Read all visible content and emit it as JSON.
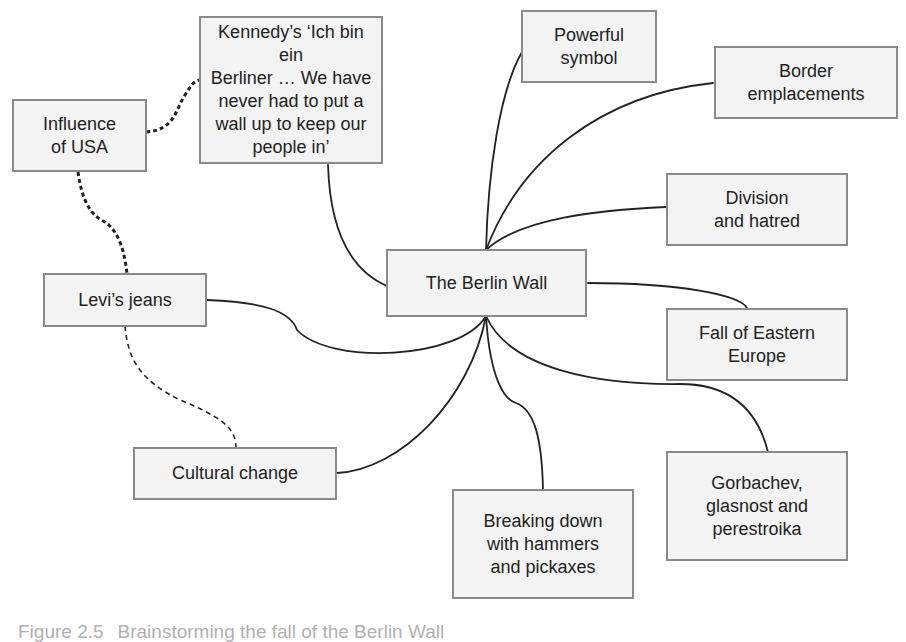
{
  "diagram": {
    "type": "mind-map",
    "central_node": {
      "id": "berlin-wall",
      "label": "The Berlin Wall"
    },
    "nodes": [
      {
        "id": "kennedy",
        "label": "Kennedy’s ‘Ich bin ein\nBerliner … We have\nnever had to put a\nwall up to keep our\npeople in’"
      },
      {
        "id": "influence-usa",
        "label": "Influence\nof USA"
      },
      {
        "id": "powerful-symbol",
        "label": "Powerful\nsymbol"
      },
      {
        "id": "border-emplacements",
        "label": "Border\nemplacements"
      },
      {
        "id": "division-hatred",
        "label": "Division\nand hatred"
      },
      {
        "id": "levis-jeans",
        "label": "Levi’s jeans"
      },
      {
        "id": "fall-eastern-europe",
        "label": "Fall of Eastern\nEurope"
      },
      {
        "id": "cultural-change",
        "label": "Cultural change"
      },
      {
        "id": "gorbachev",
        "label": "Gorbachev,\nglasnost and\nperestroika"
      },
      {
        "id": "breaking-down",
        "label": "Breaking down\nwith hammers\nand pickaxes"
      }
    ],
    "edges": [
      {
        "from": "berlin-wall",
        "to": "kennedy",
        "style": "solid"
      },
      {
        "from": "berlin-wall",
        "to": "powerful-symbol",
        "style": "solid"
      },
      {
        "from": "berlin-wall",
        "to": "border-emplacements",
        "style": "solid"
      },
      {
        "from": "berlin-wall",
        "to": "division-hatred",
        "style": "solid"
      },
      {
        "from": "berlin-wall",
        "to": "fall-eastern-europe",
        "style": "solid"
      },
      {
        "from": "berlin-wall",
        "to": "levis-jeans",
        "style": "solid"
      },
      {
        "from": "berlin-wall",
        "to": "cultural-change",
        "style": "solid"
      },
      {
        "from": "berlin-wall",
        "to": "breaking-down",
        "style": "solid"
      },
      {
        "from": "berlin-wall",
        "to": "gorbachev",
        "style": "solid"
      },
      {
        "from": "influence-usa",
        "to": "kennedy",
        "style": "dotted-bold"
      },
      {
        "from": "influence-usa",
        "to": "levis-jeans",
        "style": "dotted-bold"
      },
      {
        "from": "levis-jeans",
        "to": "cultural-change",
        "style": "dashed"
      }
    ],
    "colors": {
      "node_fill": "#f3f3f3",
      "node_border": "#8a8a8a",
      "text": "#222222",
      "connector": "#222222",
      "caption": "#b0b0b0"
    }
  },
  "caption": {
    "figure_number": "Figure 2.5",
    "text": "Brainstorming the fall of the Berlin Wall"
  }
}
